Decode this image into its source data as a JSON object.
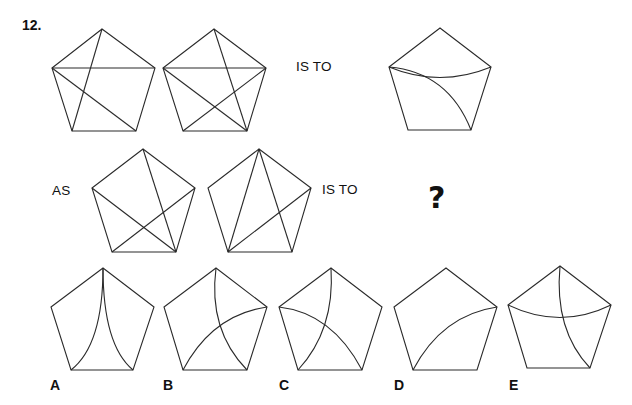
{
  "question": {
    "number": "12.",
    "connector_is_to_1": "IS TO",
    "connector_as": "AS",
    "connector_is_to_2": "IS TO",
    "unknown": "?"
  },
  "colors": {
    "stroke": "#2a2a2a",
    "text": "#111111",
    "background": "#ffffff"
  },
  "figures": [
    {
      "id": "fig-1",
      "verts": {
        "T": [
          102,
          29
        ],
        "L": [
          52,
          68
        ],
        "R": [
          155,
          68
        ],
        "BL": [
          72,
          131
        ],
        "BR": [
          136,
          131
        ]
      },
      "lines": [
        [
          "L",
          "R"
        ],
        [
          "L",
          "BR"
        ],
        [
          "T",
          "BL"
        ]
      ],
      "curves": []
    },
    {
      "id": "fig-2",
      "verts": {
        "T": [
          214,
          29
        ],
        "L": [
          163,
          68
        ],
        "R": [
          266,
          68
        ],
        "BL": [
          183,
          131
        ],
        "BR": [
          247,
          131
        ]
      },
      "lines": [
        [
          "L",
          "R"
        ],
        [
          "L",
          "BR"
        ],
        [
          "T",
          "BR"
        ],
        [
          "R",
          "BL"
        ]
      ],
      "curves": []
    },
    {
      "id": "fig-3",
      "verts": {
        "T": [
          440,
          28
        ],
        "L": [
          389,
          67
        ],
        "R": [
          491,
          67
        ],
        "BL": [
          408,
          130
        ],
        "BR": [
          471,
          130
        ]
      },
      "lines": [],
      "curves": [
        {
          "from": "L",
          "to": "R",
          "ctrl": [
            440,
            88
          ]
        },
        {
          "from": "L",
          "to": "BR",
          "ctrl": [
            448,
            72
          ]
        }
      ]
    },
    {
      "id": "fig-4",
      "verts": {
        "T": [
          143,
          149
        ],
        "L": [
          92,
          188
        ],
        "R": [
          195,
          188
        ],
        "BL": [
          112,
          252
        ],
        "BR": [
          176,
          252
        ]
      },
      "lines": [
        [
          "T",
          "BR"
        ],
        [
          "L",
          "BR"
        ],
        [
          "R",
          "BL"
        ]
      ],
      "curves": []
    },
    {
      "id": "fig-5",
      "verts": {
        "T": [
          259,
          149
        ],
        "L": [
          208,
          188
        ],
        "R": [
          311,
          188
        ],
        "BL": [
          228,
          252
        ],
        "BR": [
          292,
          252
        ]
      },
      "lines": [
        [
          "T",
          "BL"
        ],
        [
          "T",
          "BR"
        ],
        [
          "R",
          "BL"
        ]
      ],
      "curves": []
    }
  ],
  "options": [
    {
      "label": "A",
      "label_pos": [
        50,
        377
      ],
      "verts": {
        "T": [
          103,
          268
        ],
        "L": [
          51,
          307
        ],
        "R": [
          154,
          307
        ],
        "BL": [
          71,
          370
        ],
        "BR": [
          133,
          370
        ]
      },
      "curves": [
        {
          "from": "T",
          "to": "BL",
          "ctrl": [
            103,
            345
          ]
        },
        {
          "from": "T",
          "to": "BR",
          "ctrl": [
            103,
            345
          ]
        }
      ]
    },
    {
      "label": "B",
      "label_pos": [
        163,
        377
      ],
      "verts": {
        "T": [
          216,
          268
        ],
        "L": [
          164,
          307
        ],
        "R": [
          267,
          307
        ],
        "BL": [
          183,
          370
        ],
        "BR": [
          247,
          370
        ]
      },
      "curves": [
        {
          "from": "T",
          "to": "BR",
          "ctrl": [
            208,
            330
          ]
        },
        {
          "from": "R",
          "to": "BL",
          "ctrl": [
            212,
            315
          ]
        }
      ]
    },
    {
      "label": "C",
      "label_pos": [
        279,
        377
      ],
      "verts": {
        "T": [
          331,
          268
        ],
        "L": [
          279,
          307
        ],
        "R": [
          382,
          307
        ],
        "BL": [
          298,
          370
        ],
        "BR": [
          362,
          370
        ]
      },
      "curves": [
        {
          "from": "T",
          "to": "BL",
          "ctrl": [
            335,
            330
          ]
        },
        {
          "from": "L",
          "to": "BR",
          "ctrl": [
            332,
            313
          ]
        }
      ]
    },
    {
      "label": "D",
      "label_pos": [
        394,
        377
      ],
      "verts": {
        "T": [
          446,
          268
        ],
        "L": [
          394,
          307
        ],
        "R": [
          497,
          307
        ],
        "BL": [
          413,
          370
        ],
        "BR": [
          477,
          370
        ]
      },
      "curves": [
        {
          "from": "R",
          "to": "BL",
          "ctrl": [
            442,
            315
          ]
        }
      ]
    },
    {
      "label": "E",
      "label_pos": [
        509,
        377
      ],
      "verts": {
        "T": [
          560,
          266
        ],
        "L": [
          508,
          305
        ],
        "R": [
          611,
          305
        ],
        "BL": [
          527,
          368
        ],
        "BR": [
          590,
          368
        ]
      },
      "curves": [
        {
          "from": "L",
          "to": "R",
          "ctrl": [
            560,
            330
          ]
        },
        {
          "from": "T",
          "to": "BR",
          "ctrl": [
            554,
            330
          ]
        }
      ]
    }
  ]
}
